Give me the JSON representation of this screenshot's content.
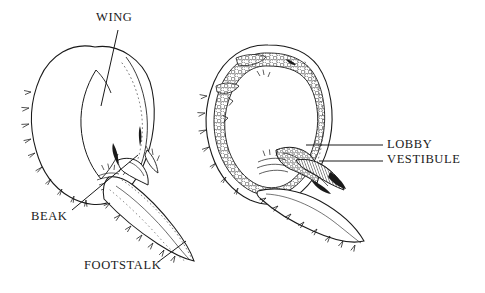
{
  "figure": {
    "kind": "scientific-illustration",
    "background_color": "#ffffff",
    "ink_color": "#1a1a1a",
    "width": 485,
    "height": 293,
    "panels": [
      {
        "id": "external-view",
        "position": "left",
        "description": "whole animal external view with capitulum and footstalk"
      },
      {
        "id": "section-view",
        "position": "right",
        "description": "cut-away section showing internal chambers and stippled tissue"
      }
    ]
  },
  "labels": {
    "wing": "WING",
    "beak": "BEAK",
    "footstalk": "FOOTSTALK",
    "lobby": "LOBBY",
    "vestibule": "VESTIBULE"
  }
}
